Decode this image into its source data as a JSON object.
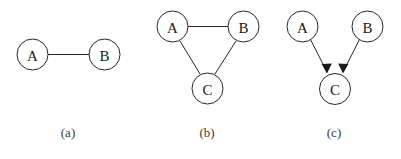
{
  "figure": {
    "width": 401,
    "height": 159,
    "background_color": "#ffffff",
    "stroke_color": "#262626",
    "label_color": "#1a1a1a",
    "caption_color": "#3a3a3a"
  },
  "subfigures": [
    {
      "id": "a",
      "caption": "(a)",
      "caption_x": 68,
      "caption_y": 137,
      "graph_type": "undirected",
      "nodes": [
        {
          "label": "A",
          "cx": 32.5,
          "cy": 54.5,
          "r": 15.5
        },
        {
          "label": "B",
          "cx": 104.5,
          "cy": 54.5,
          "r": 15.5
        }
      ],
      "edges": [
        {
          "from": "A",
          "to": "B",
          "directed": false,
          "x1": 48,
          "y1": 54.5,
          "x2": 89,
          "y2": 54.5
        }
      ]
    },
    {
      "id": "b",
      "caption": "(b)",
      "caption_x": 207,
      "caption_y": 137,
      "graph_type": "undirected",
      "nodes": [
        {
          "label": "A",
          "cx": 172.5,
          "cy": 26.5,
          "r": 15.5
        },
        {
          "label": "B",
          "cx": 243.5,
          "cy": 26.5,
          "r": 15.5
        },
        {
          "label": "C",
          "cx": 207.5,
          "cy": 88.5,
          "r": 15.5
        }
      ],
      "edges": [
        {
          "from": "A",
          "to": "B",
          "directed": false,
          "x1": 188,
          "y1": 26.5,
          "x2": 228,
          "y2": 26.5
        },
        {
          "from": "A",
          "to": "C",
          "directed": false,
          "x1": 179.6,
          "y1": 40.4,
          "x2": 200.4,
          "y2": 74.6
        },
        {
          "from": "B",
          "to": "C",
          "directed": false,
          "x1": 236.4,
          "y1": 40.4,
          "x2": 214.6,
          "y2": 74.6
        }
      ]
    },
    {
      "id": "c",
      "caption": "(c)",
      "caption_x": 334,
      "caption_y": 137,
      "graph_type": "directed",
      "nodes": [
        {
          "label": "A",
          "cx": 302.5,
          "cy": 26.5,
          "r": 15.5
        },
        {
          "label": "B",
          "cx": 367.5,
          "cy": 26.5,
          "r": 15.5
        },
        {
          "label": "C",
          "cx": 335.0,
          "cy": 89.0,
          "r": 15.5
        }
      ],
      "edges": [
        {
          "from": "A",
          "to": "C",
          "directed": true,
          "x1": 310.6,
          "y1": 39.7,
          "x2": 327.0,
          "y2": 72.0
        },
        {
          "from": "B",
          "to": "C",
          "directed": true,
          "x1": 359.4,
          "y1": 39.7,
          "x2": 343.0,
          "y2": 72.0
        }
      ]
    }
  ]
}
